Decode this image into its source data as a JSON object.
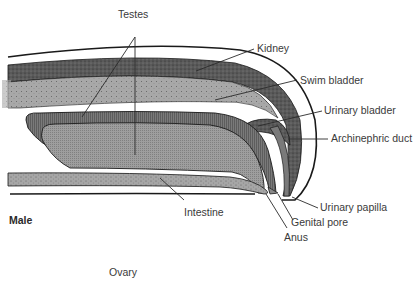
{
  "diagram": {
    "type": "anatomical-cross-section",
    "section_label": "Male",
    "caption_below": "Ovary",
    "labels": {
      "testes": "Testes",
      "kidney": "Kidney",
      "swim_bladder": "Swim bladder",
      "urinary_bladder": "Urinary bladder",
      "archinephric_duct": "Archinephric duct",
      "urinary_papilla": "Urinary papilla",
      "intestine": "Intestine",
      "genital_pore": "Genital pore",
      "anus": "Anus"
    },
    "colors": {
      "kidney_fill": "#5a5a5a",
      "swim_bladder_fill": "#a8a8a8",
      "testes_outer_fill": "#6e6e6e",
      "testes_inner_fill": "#9a9a9a",
      "intestine_fill": "#a6a6a6",
      "outline": "#1a1a1a",
      "label_text": "#3a3a3a",
      "background": "#ffffff"
    }
  }
}
